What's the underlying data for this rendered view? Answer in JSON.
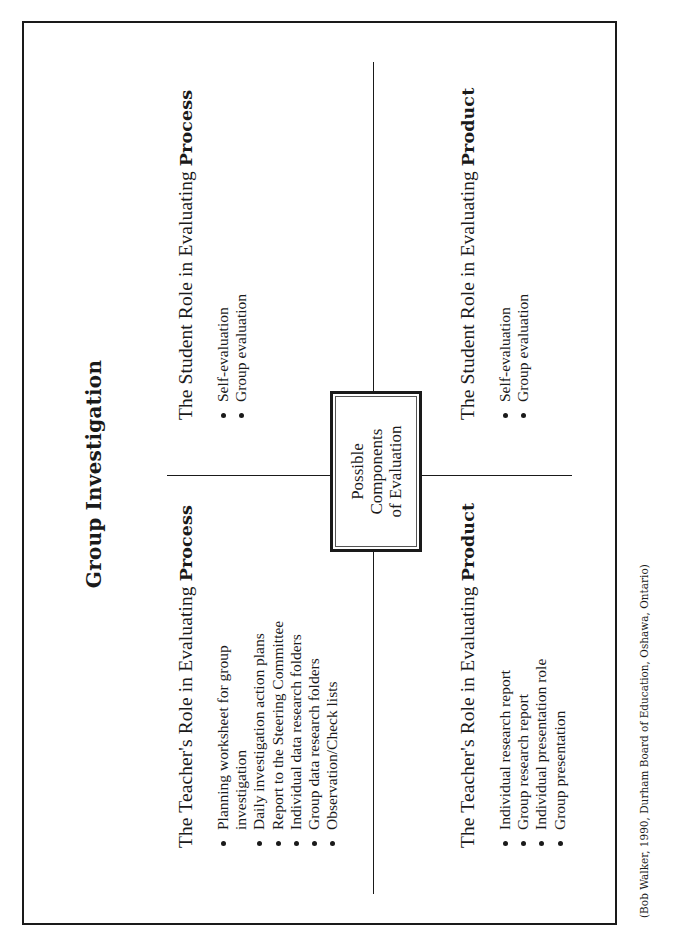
{
  "title": "Group Investigation",
  "center_box": {
    "lines": [
      "Possible",
      "Components",
      "of Evaluation"
    ]
  },
  "quadrants": {
    "teacher_process": {
      "heading_prefix": "The Teacher's Role in Evaluating ",
      "heading_bold": "Process",
      "items": [
        "Planning worksheet for group",
        "investigation",
        "Daily investigation action plans",
        "Report to the Steering Committee",
        "Individual data research folders",
        "Group data research folders",
        "Observation/Check lists"
      ]
    },
    "student_process": {
      "heading_prefix": "The Student Role in Evaluating ",
      "heading_bold": "Process",
      "items": [
        "Self-evaluation",
        "Group evaluation"
      ]
    },
    "teacher_product": {
      "heading_prefix": "The Teacher's Role in Evaluating ",
      "heading_bold": "Product",
      "items": [
        "Individual research report",
        "Group research report",
        "Individual presentation role",
        "Group presentation"
      ]
    },
    "student_product": {
      "heading_prefix": "The Student Role in Evaluating ",
      "heading_bold": "Product",
      "items": [
        "Self-evaluation",
        "Group evaluation"
      ]
    }
  },
  "citation": "(Bob Walker, 1990, Durham Board of Education, Oshawa, Ontario)"
}
